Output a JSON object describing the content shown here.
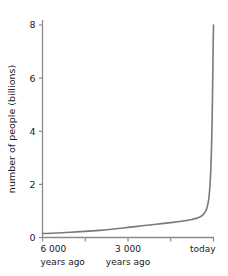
{
  "chart_data": {
    "type": "line",
    "title": "",
    "subtitle": "",
    "xlabel": "",
    "ylabel": "number of people (billions)",
    "grid": false,
    "legend": false,
    "legend_position": "none",
    "line_color": "#7a7a7a",
    "axis_color": "#8a8a8a",
    "background_color": "#ffffff",
    "xlim": [
      -6000,
      0
    ],
    "ylim": [
      0,
      8.4
    ],
    "x_unit": "years ago",
    "x_ticks": [
      {
        "value": -6000,
        "line1": "6 000",
        "line2": "years ago"
      },
      {
        "value": -4500,
        "line1": "",
        "line2": ""
      },
      {
        "value": -3000,
        "line1": "3 000",
        "line2": "years ago"
      },
      {
        "value": -1500,
        "line1": "",
        "line2": ""
      },
      {
        "value": 0,
        "line1": "today",
        "line2": ""
      }
    ],
    "y_ticks": [
      {
        "value": 0,
        "label": "0"
      },
      {
        "value": 2,
        "label": "2"
      },
      {
        "value": 4,
        "label": "4"
      },
      {
        "value": 6,
        "label": "6"
      },
      {
        "value": 8,
        "label": "8"
      }
    ],
    "x": [
      -6000,
      -5500,
      -5000,
      -4500,
      -4000,
      -3500,
      -3000,
      -2500,
      -2000,
      -1500,
      -1200,
      -1000,
      -800,
      -600,
      -500,
      -400,
      -300,
      -250,
      -200,
      -150,
      -100,
      -70,
      -50,
      -30,
      -15,
      0
    ],
    "values": [
      0.15,
      0.17,
      0.2,
      0.23,
      0.27,
      0.32,
      0.38,
      0.44,
      0.5,
      0.56,
      0.6,
      0.63,
      0.67,
      0.72,
      0.76,
      0.82,
      0.95,
      1.05,
      1.25,
      1.6,
      2.4,
      3.4,
      4.3,
      5.7,
      7.0,
      8.0
    ],
    "series": [
      {
        "name": "world population",
        "color": "#7a7a7a",
        "values": [
          0.15,
          0.17,
          0.2,
          0.23,
          0.27,
          0.32,
          0.38,
          0.44,
          0.5,
          0.56,
          0.6,
          0.63,
          0.67,
          0.72,
          0.76,
          0.82,
          0.95,
          1.05,
          1.25,
          1.6,
          2.4,
          3.4,
          4.3,
          5.7,
          7.0,
          8.0
        ]
      }
    ],
    "annotations": []
  }
}
